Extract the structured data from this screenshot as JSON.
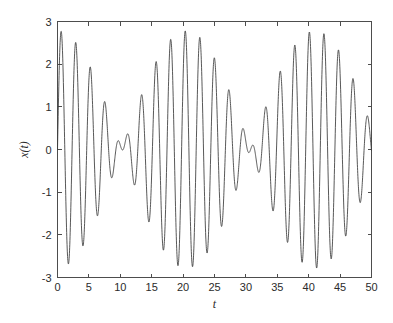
{
  "figure": {
    "background_color": "#ffffff",
    "axes_color": "#4d4d4d",
    "line_color": "#3a3a3a"
  },
  "chart_data": {
    "type": "line",
    "title": "",
    "subtitle": "",
    "xlabel": "t",
    "ylabel": "x(t)",
    "xlim": [
      0,
      50
    ],
    "ylim": [
      -3,
      3
    ],
    "xticks": [
      0,
      5,
      10,
      15,
      20,
      25,
      30,
      35,
      40,
      45,
      50
    ],
    "xticklabels": [
      "0",
      "5",
      "10",
      "15",
      "20",
      "25",
      "30",
      "35",
      "40",
      "45",
      "50"
    ],
    "yticks": [
      -3,
      -2,
      -1,
      0,
      1,
      2,
      3
    ],
    "yticklabels": [
      "-3",
      "-2",
      "-1",
      "0",
      "1",
      "2",
      "3"
    ],
    "grid": false,
    "legend": null,
    "legend_position": "none",
    "annotations": [],
    "box": true,
    "tick_direction": "in",
    "model": {
      "form": "x(t) = A*sin(w1*t) + A*sin(w2*t)",
      "amplitude": 1.39,
      "omega1": 2.8559,
      "omega2": 2.5494,
      "carrier_period": 2.2,
      "beat_period": 20.5,
      "peak_amplitude": 2.78,
      "samples": 2400
    },
    "series": [
      {
        "name": "x(t)",
        "color": "#3a3a3a",
        "linewidth": 0.85,
        "style": "solid"
      }
    ],
    "envelope_nodes": [
      0,
      21.5,
      41.5
    ],
    "envelope_antinodes": [
      10.5,
      31.0
    ],
    "extrema_observed": [
      {
        "t": 1.1,
        "x": 0.45
      },
      {
        "t": 2.8,
        "x": 1.34
      },
      {
        "t": 4.3,
        "x": -1.72
      },
      {
        "t": 5.2,
        "x": 2.04
      },
      {
        "t": 7.5,
        "x": 2.53
      },
      {
        "t": 8.8,
        "x": -2.3
      },
      {
        "t": 9.7,
        "x": 2.76
      },
      {
        "t": 11.0,
        "x": -2.72
      },
      {
        "t": 11.9,
        "x": 2.68
      },
      {
        "t": 13.2,
        "x": -2.5
      },
      {
        "t": 14.1,
        "x": 2.32
      },
      {
        "t": 15.4,
        "x": -2.04
      },
      {
        "t": 16.3,
        "x": 1.7
      },
      {
        "t": 17.6,
        "x": -1.3
      },
      {
        "t": 18.5,
        "x": 0.9
      },
      {
        "t": 20.0,
        "x": -0.27
      },
      {
        "t": 21.5,
        "x": 0.13
      },
      {
        "t": 22.2,
        "x": 0.46
      },
      {
        "t": 23.0,
        "x": -0.42
      },
      {
        "t": 24.0,
        "x": 1.33
      },
      {
        "t": 25.2,
        "x": -1.7
      },
      {
        "t": 26.3,
        "x": 2.04
      },
      {
        "t": 27.5,
        "x": -2.3
      },
      {
        "t": 28.4,
        "x": 2.55
      },
      {
        "t": 29.8,
        "x": -2.66
      },
      {
        "t": 30.7,
        "x": 2.78
      },
      {
        "t": 32.0,
        "x": -2.76
      },
      {
        "t": 32.9,
        "x": 2.7
      },
      {
        "t": 34.1,
        "x": -2.47
      },
      {
        "t": 35.0,
        "x": 2.33
      },
      {
        "t": 36.4,
        "x": -2.05
      },
      {
        "t": 37.2,
        "x": 1.7
      },
      {
        "t": 38.5,
        "x": -1.3
      },
      {
        "t": 39.4,
        "x": 0.95
      },
      {
        "t": 41.0,
        "x": -0.4
      },
      {
        "t": 42.8,
        "x": 0.47
      },
      {
        "t": 44.0,
        "x": -0.86
      },
      {
        "t": 45.1,
        "x": 1.34
      },
      {
        "t": 46.2,
        "x": -1.67
      },
      {
        "t": 47.4,
        "x": 2.04
      },
      {
        "t": 48.6,
        "x": -2.28
      },
      {
        "t": 49.6,
        "x": 2.55
      }
    ]
  }
}
